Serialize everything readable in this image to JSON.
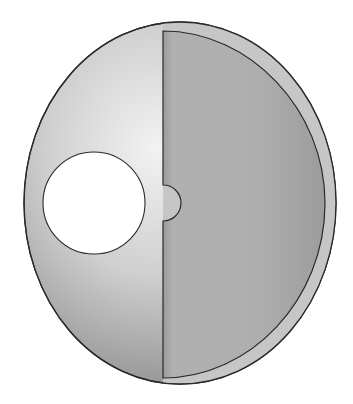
{
  "diagram": {
    "colors": {
      "background": "#ffffff",
      "outline": "#2a2a2a",
      "left_face_light": "#e6e6e6",
      "left_face_dark": "#9c9c9c",
      "right_face": "#a8a8a8",
      "rim": "#c4c4c4",
      "hole": "#ffffff"
    }
  }
}
